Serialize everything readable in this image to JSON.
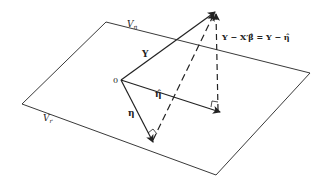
{
  "labels": {
    "plane_vn": "V",
    "plane_vn_sub": "n",
    "plane_vr": "V",
    "plane_vr_sub": "r",
    "origin": "0",
    "vec_y": "Y",
    "vec_eta_hat": "η̂",
    "vec_eta": "η",
    "residual_eq": "Y − X′β̂ = Y − η̂"
  },
  "colors": {
    "line": "#222222",
    "background": "#ffffff"
  }
}
